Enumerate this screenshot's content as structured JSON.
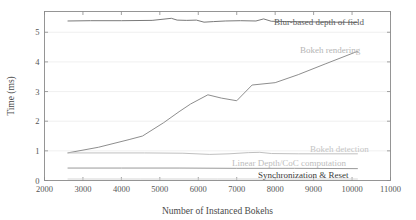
{
  "chart_data": {
    "type": "line",
    "title": "",
    "xlabel": "Number of Instanced Bokehs",
    "ylabel": "Time (ms)",
    "xlim": [
      2000,
      11000
    ],
    "ylim": [
      0,
      5.7
    ],
    "xticks": [
      2000,
      3000,
      4000,
      5000,
      6000,
      7000,
      8000,
      9000,
      10000,
      11000
    ],
    "yticks": [
      0,
      1,
      2,
      3,
      4,
      5
    ],
    "grid": true,
    "grid_axis": "y",
    "legend_position": "inline-right-annotations",
    "series": [
      {
        "name": "Blur-based depth of field",
        "color": "#7a7a7a",
        "label_color": "#5a5a5a",
        "x": [
          2600,
          3200,
          4000,
          4800,
          5300,
          5450,
          5700,
          5950,
          6150,
          6400,
          6700,
          7100,
          7500,
          7700,
          7900,
          8300,
          8900,
          9500,
          10150
        ],
        "y": [
          5.38,
          5.39,
          5.39,
          5.4,
          5.47,
          5.41,
          5.4,
          5.41,
          5.34,
          5.36,
          5.38,
          5.39,
          5.38,
          5.45,
          5.37,
          5.36,
          5.35,
          5.34,
          5.33
        ]
      },
      {
        "name": "Bokeh rendering",
        "color": "#8e8e8e",
        "label_color": "#b5b5b5",
        "x": [
          2600,
          3400,
          4200,
          4550,
          5100,
          5500,
          5800,
          6250,
          6600,
          7000,
          7400,
          8000,
          8600,
          9300,
          10150
        ],
        "y": [
          0.93,
          1.12,
          1.38,
          1.5,
          1.95,
          2.32,
          2.58,
          2.89,
          2.78,
          2.69,
          3.22,
          3.3,
          3.57,
          3.93,
          4.36
        ]
      },
      {
        "name": "Bokeh detection",
        "color": "#c0c0c0",
        "label_color": "#c4c4c4",
        "x": [
          2600,
          3600,
          4600,
          5600,
          6300,
          6800,
          7300,
          7600,
          7900,
          8600,
          9400,
          10150
        ],
        "y": [
          0.93,
          0.93,
          0.93,
          0.92,
          0.88,
          0.9,
          0.94,
          0.95,
          0.91,
          0.9,
          0.9,
          0.9
        ]
      },
      {
        "name": "Linear Depth/CoC computation",
        "color": "#9a9a9a",
        "label_color": "#bdbdbd",
        "x": [
          2600,
          4000,
          5500,
          7000,
          8500,
          10150
        ],
        "y": [
          0.42,
          0.42,
          0.42,
          0.41,
          0.41,
          0.4
        ]
      },
      {
        "name": "Synchronization & Reset",
        "color": "#d6d6d6",
        "label_color": "#3a3a3a",
        "x": [
          2600,
          4500,
          6500,
          8500,
          10150
        ],
        "y": [
          0.05,
          0.05,
          0.05,
          0.05,
          0.05
        ]
      }
    ],
    "annotations": [
      {
        "text": "Blur-based depth of field",
        "x_px": 274,
        "y_px": 25,
        "anchor": "start"
      },
      {
        "text": "Bokeh rendering",
        "x_px": 300,
        "y_px": 53,
        "anchor": "start"
      },
      {
        "text": "Bokeh detection",
        "x_px": 310,
        "y_px": 152,
        "anchor": "start"
      },
      {
        "text": "Linear Depth/CoC computation",
        "x_px": 232,
        "y_px": 166,
        "anchor": "start"
      },
      {
        "text": "Synchronization & Reset",
        "x_px": 258,
        "y_px": 178,
        "anchor": "start"
      }
    ]
  },
  "axes": {
    "x_tick_labels": [
      "2000",
      "3000",
      "4000",
      "5000",
      "6000",
      "7000",
      "8000",
      "9000",
      "10000",
      "11000"
    ],
    "y_tick_labels": [
      "0",
      "1",
      "2",
      "3",
      "4",
      "5"
    ],
    "x_axis_title": "Number of Instanced Bokehs",
    "y_axis_title": "Time (ms)"
  }
}
